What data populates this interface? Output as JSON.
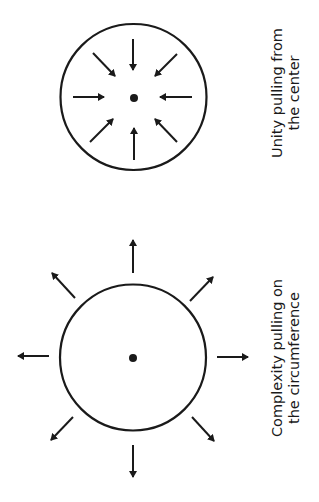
{
  "figure": {
    "stroke_color": "#1a1a1a",
    "background": "#ffffff"
  },
  "unity": {
    "caption_line1": "Unity pulling from",
    "caption_line2": "the center",
    "circle": {
      "cx": 133.5,
      "cy": 97,
      "r": 73
    },
    "center_dot": {
      "cx": 134,
      "cy": 98,
      "r": 4
    },
    "arrow_direction": "inward",
    "arrows": [
      {
        "name": "inward-arrow-top",
        "x1": 133,
        "y1": 39,
        "x2": 133,
        "y2": 70
      },
      {
        "name": "inward-arrow-top-right",
        "x1": 177,
        "y1": 54,
        "x2": 155,
        "y2": 76
      },
      {
        "name": "inward-arrow-right",
        "x1": 192,
        "y1": 97,
        "x2": 160,
        "y2": 97
      },
      {
        "name": "inward-arrow-bottom-right",
        "x1": 177,
        "y1": 142,
        "x2": 155,
        "y2": 119
      },
      {
        "name": "inward-arrow-bottom",
        "x1": 134,
        "y1": 160,
        "x2": 134,
        "y2": 128
      },
      {
        "name": "inward-arrow-bottom-left",
        "x1": 90,
        "y1": 142,
        "x2": 113,
        "y2": 119
      },
      {
        "name": "inward-arrow-left",
        "x1": 73,
        "y1": 97,
        "x2": 104,
        "y2": 97
      },
      {
        "name": "inward-arrow-top-left",
        "x1": 93,
        "y1": 53,
        "x2": 115,
        "y2": 76
      }
    ]
  },
  "complexity": {
    "caption_line1": "Complexity pulling on",
    "caption_line2": "the circumference",
    "circle": {
      "cx": 133,
      "cy": 357.5,
      "r": 73
    },
    "center_dot": {
      "cx": 133,
      "cy": 358,
      "r": 4
    },
    "arrow_direction": "outward",
    "arrows": [
      {
        "name": "outward-arrow-top",
        "x1": 133,
        "y1": 273,
        "x2": 133,
        "y2": 240
      },
      {
        "name": "outward-arrow-top-right",
        "x1": 190,
        "y1": 301,
        "x2": 213,
        "y2": 277
      },
      {
        "name": "outward-arrow-right",
        "x1": 217,
        "y1": 357,
        "x2": 248,
        "y2": 357
      },
      {
        "name": "outward-arrow-bottom-right",
        "x1": 192,
        "y1": 417,
        "x2": 214,
        "y2": 441
      },
      {
        "name": "outward-arrow-bottom",
        "x1": 133,
        "y1": 445,
        "x2": 133,
        "y2": 477
      },
      {
        "name": "outward-arrow-bottom-left",
        "x1": 73,
        "y1": 417,
        "x2": 51,
        "y2": 440
      },
      {
        "name": "outward-arrow-left",
        "x1": 49,
        "y1": 356,
        "x2": 18,
        "y2": 356
      },
      {
        "name": "outward-arrow-top-left",
        "x1": 75,
        "y1": 298,
        "x2": 52,
        "y2": 273
      }
    ]
  }
}
